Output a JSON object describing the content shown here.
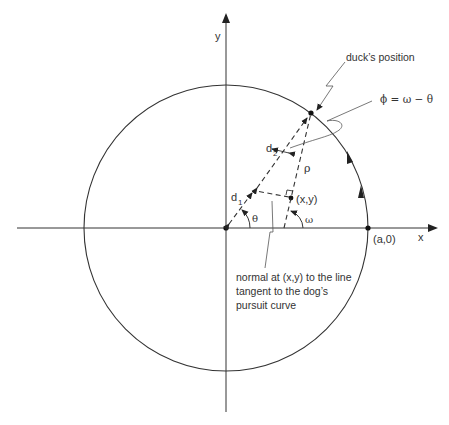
{
  "diagram": {
    "axes": {
      "x_label": "x",
      "y_label": "y"
    },
    "points": {
      "circle_point": "(a,0)",
      "dog_point": "(x,y)"
    },
    "labels": {
      "d1": "d",
      "d1_sub": "1",
      "d2": "d",
      "d2_sub": "2",
      "rho": "ρ",
      "theta": "θ",
      "omega": "ω",
      "phi_eq": "ϕ = ω − θ",
      "duck": "duck’s position"
    },
    "annotation": {
      "line1": "normal at (x,y) to the line",
      "line2": "tangent to the dog’s",
      "line3": "pursuit curve"
    },
    "colors": {
      "stroke": "#333333",
      "leader": "#555555",
      "background": "#ffffff"
    }
  }
}
